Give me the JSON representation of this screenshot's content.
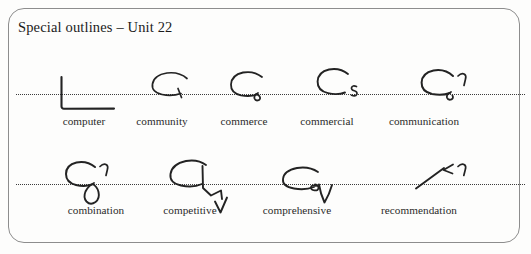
{
  "card": {
    "title": "Special outlines – Unit 22",
    "border_color": "#8d8d8d",
    "background_color": "#fdfdfc",
    "ink_color": "#232323",
    "baseline_color": "#3c3c3c"
  },
  "rows": [
    {
      "row_label": "practice-row-1",
      "items": [
        {
          "word": "computer",
          "outline_name": "shorthand-outline-computer"
        },
        {
          "word": "community",
          "outline_name": "shorthand-outline-community"
        },
        {
          "word": "commerce",
          "outline_name": "shorthand-outline-commerce"
        },
        {
          "word": "commercial",
          "outline_name": "shorthand-outline-commercial"
        },
        {
          "word": "communication",
          "outline_name": "shorthand-outline-communication"
        }
      ]
    },
    {
      "row_label": "practice-row-2",
      "items": [
        {
          "word": "combination",
          "outline_name": "shorthand-outline-combination"
        },
        {
          "word": "competitive",
          "outline_name": "shorthand-outline-competitive"
        },
        {
          "word": "comprehensive",
          "outline_name": "shorthand-outline-comprehensive"
        },
        {
          "word": "recommendation",
          "outline_name": "shorthand-outline-recommendation"
        }
      ]
    }
  ]
}
